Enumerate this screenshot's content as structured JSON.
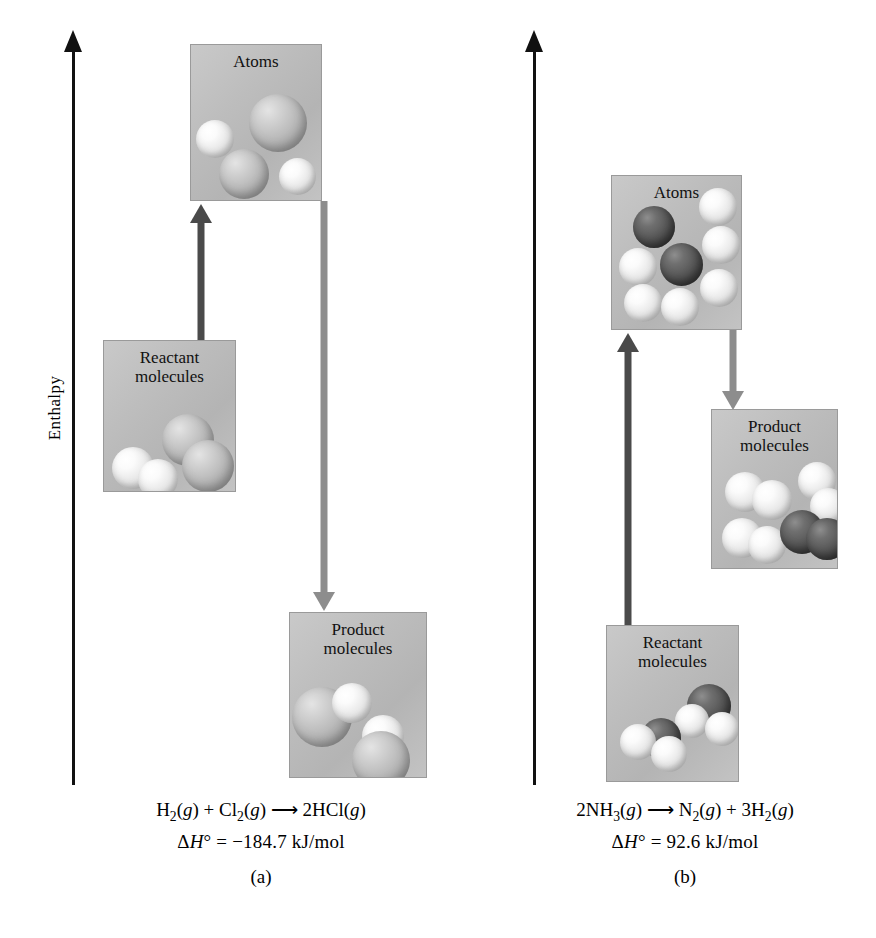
{
  "figure": {
    "axis_label": "Enthalpy"
  },
  "panels": [
    {
      "id": "a",
      "label": "(a)",
      "equation_html": "H<sub>2</sub>(<span class=\"ital\">g</span>) + Cl<sub>2</sub>(<span class=\"ital\">g</span>) ⟶ 2HCl(<span class=\"ital\">g</span>)",
      "equation_text": "H2(g) + Cl2(g) → 2HCl(g)",
      "enthalpy_html": "Δ<span class=\"ital\">H</span>° = −184.7 kJ/mol",
      "enthalpy_text": "ΔH° = −184.7 kJ/mol",
      "enthalpy_value": -184.7,
      "enthalpy_units": "kJ/mol",
      "process": "exothermic",
      "boxes": [
        {
          "name": "atoms",
          "caption": "Atoms",
          "contents": "2 H atoms, 2 Cl atoms"
        },
        {
          "name": "reactants",
          "caption": "Reactant\nmolecules",
          "contents": "H2 and Cl2"
        },
        {
          "name": "products",
          "caption": "Product\nmolecules",
          "contents": "2 HCl"
        }
      ],
      "arrows": [
        {
          "name": "bond-breaking-arrow",
          "direction": "up",
          "color": "#4a4a4a",
          "from": "reactants",
          "to": "atoms"
        },
        {
          "name": "bond-forming-arrow",
          "direction": "down",
          "color": "#8d8d8d",
          "from": "atoms",
          "to": "products"
        }
      ]
    },
    {
      "id": "b",
      "label": "(b)",
      "equation_html": "2NH<sub>3</sub>(<span class=\"ital\">g</span>) ⟶ N<sub>2</sub>(<span class=\"ital\">g</span>) + 3H<sub>2</sub>(<span class=\"ital\">g</span>)",
      "equation_text": "2NH3(g) → N2(g) + 3H2(g)",
      "enthalpy_html": "Δ<span class=\"ital\">H</span>° = 92.6 kJ/mol",
      "enthalpy_text": "ΔH° = 92.6 kJ/mol",
      "enthalpy_value": 92.6,
      "enthalpy_units": "kJ/mol",
      "process": "endothermic",
      "boxes": [
        {
          "name": "atoms",
          "caption": "Atoms",
          "contents": "2 N atoms, 6 H atoms"
        },
        {
          "name": "reactants",
          "caption": "Reactant\nmolecules",
          "contents": "2 NH3"
        },
        {
          "name": "products",
          "caption": "Product\nmolecules",
          "contents": "3 H2 and 1 N2"
        }
      ],
      "arrows": [
        {
          "name": "bond-breaking-arrow",
          "direction": "up",
          "color": "#4a4a4a",
          "from": "reactants",
          "to": "atoms"
        },
        {
          "name": "bond-forming-arrow",
          "direction": "down",
          "color": "#8d8d8d",
          "from": "atoms",
          "to": "products"
        }
      ]
    }
  ],
  "colors": {
    "axis": "#111111",
    "box_fill": "#bdbdbd",
    "box_border": "#9a9a9a",
    "arrow_dark": "#4a4a4a",
    "arrow_light": "#8d8d8d",
    "atom_hydrogen": "#f2f2f2",
    "atom_chlorine": "#b9b9b9",
    "atom_nitrogen": "#555555"
  }
}
